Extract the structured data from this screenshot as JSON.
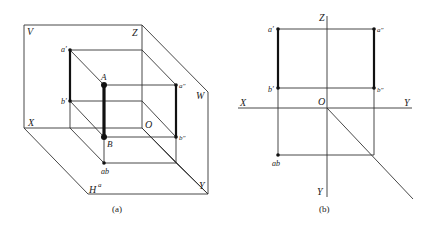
{
  "figure_a": {
    "caption": "(a)",
    "plane_labels": {
      "V": "V",
      "H": "H",
      "W": "W"
    },
    "axis_labels": {
      "X": "X",
      "Y": "Y",
      "Z": "Z",
      "O": "O"
    },
    "points": {
      "A": "A",
      "B": "B",
      "a_prime": "a′",
      "b_prime": "b′",
      "a_dprime": "a″",
      "b_dprime": "b″",
      "ab": "ab",
      "h_mark": "a"
    }
  },
  "figure_b": {
    "caption": "(b)",
    "axis_labels": {
      "X": "X",
      "Y_h": "Y",
      "Y_v": "Y",
      "Z": "Z",
      "O": "O"
    },
    "points": {
      "a_prime": "a′",
      "b_prime": "b′",
      "a_dprime": "a″",
      "b_dprime": "b″",
      "ab": "ab"
    }
  },
  "colors": {
    "line": "#333333",
    "thick": "#111111"
  }
}
